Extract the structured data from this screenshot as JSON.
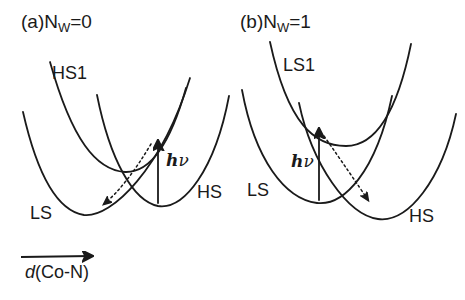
{
  "figure": {
    "background": "#ffffff",
    "line_color": "#1a1a1a",
    "panels": [
      {
        "id": "a",
        "title_prefix": "(a)N",
        "title_sub": "W",
        "title_suffix": "=0",
        "excited_curve_label": "HS1",
        "left_well_label": "LS",
        "right_well_label": "HS",
        "photon_h": "h",
        "photon_nu": "ν"
      },
      {
        "id": "b",
        "title_prefix": "(b)N",
        "title_sub": "W",
        "title_suffix": "=1",
        "excited_curve_label": "LS1",
        "left_well_label": "LS",
        "right_well_label": "HS",
        "photon_h": "h",
        "photon_nu": "ν"
      }
    ],
    "axis": {
      "label_italic": "d",
      "label_rest": "(Co-N)"
    }
  }
}
